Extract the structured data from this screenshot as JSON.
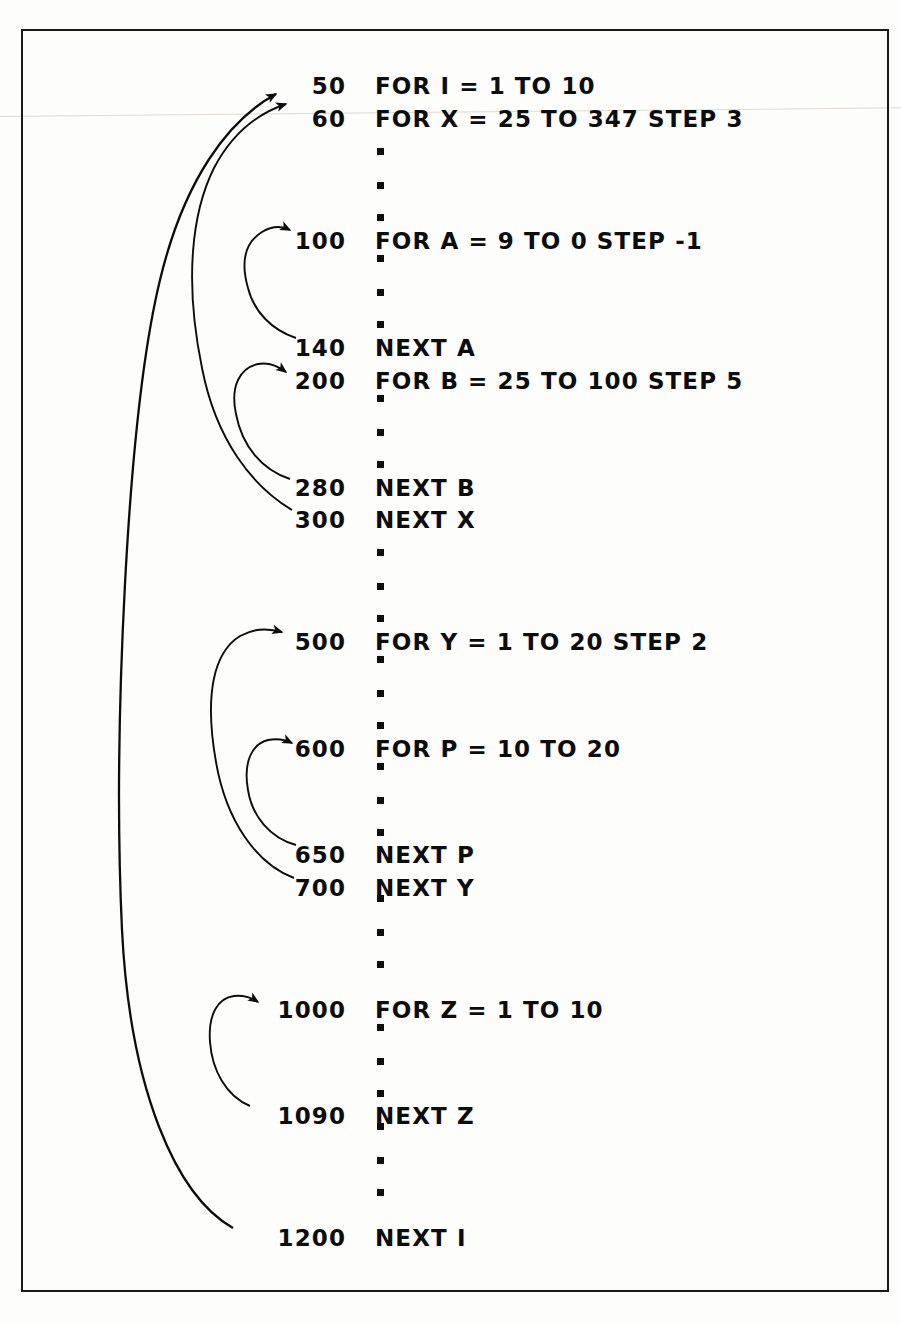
{
  "figure": {
    "kind": "basic-program-listing-with-loop-nesting-arrows",
    "frame_color": "#1a1a1a",
    "ink_color": "#0d0d0d"
  },
  "listing": {
    "lines": [
      {
        "no": "50",
        "stmt": "FOR I = 1 TO 10",
        "y": 71
      },
      {
        "no": "60",
        "stmt": "FOR X = 25 TO 347 STEP 3",
        "y": 104
      },
      {
        "no": "100",
        "stmt": "FOR A = 9 TO 0 STEP -1",
        "y": 226
      },
      {
        "no": "140",
        "stmt": "NEXT A",
        "y": 333
      },
      {
        "no": "200",
        "stmt": "FOR B = 25 TO 100 STEP 5",
        "y": 366
      },
      {
        "no": "280",
        "stmt": "NEXT B",
        "y": 473
      },
      {
        "no": "300",
        "stmt": "NEXT X",
        "y": 505
      },
      {
        "no": "500",
        "stmt": "FOR Y = 1 TO 20 STEP 2",
        "y": 627
      },
      {
        "no": "600",
        "stmt": "FOR P = 10 TO 20",
        "y": 734
      },
      {
        "no": "650",
        "stmt": "NEXT P",
        "y": 840
      },
      {
        "no": "700",
        "stmt": "NEXT Y",
        "y": 873
      },
      {
        "no": "1000",
        "stmt": "FOR Z = 1 TO 10",
        "y": 995
      },
      {
        "no": "1090",
        "stmt": "NEXT Z",
        "y": 1101
      },
      {
        "no": "1200",
        "stmt": "NEXT I",
        "y": 1223
      }
    ],
    "ellipsis_dots": [
      {
        "y": 148
      },
      {
        "y": 182
      },
      {
        "y": 214
      },
      {
        "y": 255
      },
      {
        "y": 289
      },
      {
        "y": 321
      },
      {
        "y": 395
      },
      {
        "y": 429
      },
      {
        "y": 461
      },
      {
        "y": 549
      },
      {
        "y": 583
      },
      {
        "y": 615
      },
      {
        "y": 656
      },
      {
        "y": 690
      },
      {
        "y": 722
      },
      {
        "y": 763
      },
      {
        "y": 797
      },
      {
        "y": 829
      },
      {
        "y": 895
      },
      {
        "y": 929
      },
      {
        "y": 961
      },
      {
        "y": 1024
      },
      {
        "y": 1058
      },
      {
        "y": 1090
      },
      {
        "y": 1123
      },
      {
        "y": 1157
      },
      {
        "y": 1189
      }
    ]
  },
  "loop_arrows": [
    {
      "name": "loop-i",
      "from_line": "1200",
      "to_line": "50",
      "variable": "I",
      "nesting_level": 1
    },
    {
      "name": "loop-x",
      "from_line": "300",
      "to_line": "60",
      "variable": "X",
      "nesting_level": 2
    },
    {
      "name": "loop-a",
      "from_line": "140",
      "to_line": "100",
      "variable": "A",
      "nesting_level": 3
    },
    {
      "name": "loop-b",
      "from_line": "280",
      "to_line": "200",
      "variable": "B",
      "nesting_level": 3
    },
    {
      "name": "loop-y",
      "from_line": "700",
      "to_line": "500",
      "variable": "Y",
      "nesting_level": 2
    },
    {
      "name": "loop-p",
      "from_line": "650",
      "to_line": "600",
      "variable": "P",
      "nesting_level": 3
    },
    {
      "name": "loop-z",
      "from_line": "1090",
      "to_line": "1000",
      "variable": "Z",
      "nesting_level": 2
    }
  ]
}
